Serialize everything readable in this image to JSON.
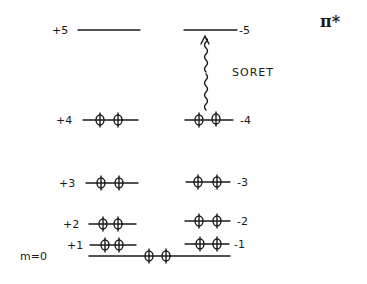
{
  "diagram": {
    "orbital_label": "π*",
    "transition_label": "SORET",
    "m_label": "m=0",
    "levels_left": [
      {
        "label": "+5",
        "y": 30,
        "x1": 78,
        "x2": 140,
        "electrons": 0
      },
      {
        "label": "+4",
        "y": 120,
        "x1": 83,
        "x2": 138,
        "electrons": 2
      },
      {
        "label": "+3",
        "y": 183,
        "x1": 86,
        "x2": 138,
        "electrons": 2
      },
      {
        "label": "+2",
        "y": 224,
        "x1": 89,
        "x2": 136,
        "electrons": 2
      },
      {
        "label": "+1",
        "y": 245,
        "x1": 90,
        "x2": 136,
        "electrons": 2
      }
    ],
    "levels_right": [
      {
        "label": "-5",
        "y": 30,
        "x1": 184,
        "x2": 237,
        "electrons": 0
      },
      {
        "label": "-4",
        "y": 120,
        "x1": 185,
        "x2": 233,
        "electrons": 2
      },
      {
        "label": "-3",
        "y": 182,
        "x1": 186,
        "x2": 230,
        "electrons": 2
      },
      {
        "label": "-2",
        "y": 221,
        "x1": 185,
        "x2": 230,
        "electrons": 2
      },
      {
        "label": "-1",
        "y": 244,
        "x1": 185,
        "x2": 229,
        "electrons": 2
      }
    ],
    "level_zero": {
      "label": "m=0",
      "y": 256,
      "x1": 89,
      "x2": 230,
      "electrons": 2
    },
    "ink_color": "#1a1a1a"
  }
}
